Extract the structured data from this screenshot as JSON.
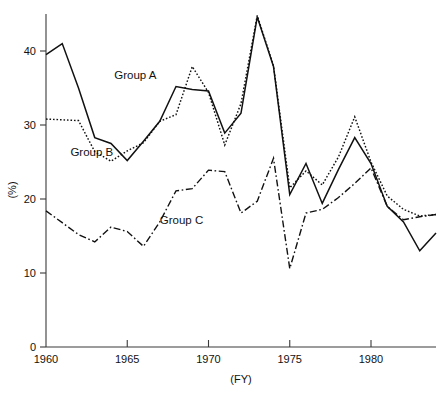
{
  "chart_data": {
    "type": "line",
    "title": "",
    "xlabel": "(FY)",
    "ylabel": "(%)",
    "xlim": [
      1960,
      1984
    ],
    "ylim": [
      0,
      45
    ],
    "xticks": [
      1960,
      1965,
      1970,
      1975,
      1980
    ],
    "xtick_labels": [
      "1960",
      "1965",
      "1970",
      "1975",
      "1980"
    ],
    "yticks": [
      0,
      10,
      20,
      30,
      40
    ],
    "ytick_labels": [
      "0",
      "10",
      "20",
      "30",
      "40"
    ],
    "grid": false,
    "legend_position": "inline-annotations",
    "x": [
      1960,
      1961,
      1962,
      1963,
      1964,
      1965,
      1966,
      1967,
      1968,
      1969,
      1970,
      1971,
      1972,
      1973,
      1974,
      1975,
      1976,
      1977,
      1978,
      1979,
      1980,
      1981,
      1982,
      1983,
      1984
    ],
    "series": [
      {
        "name": "Group A",
        "line_style": "solid",
        "values": [
          39.5,
          41.0,
          35.0,
          28.3,
          27.5,
          25.2,
          27.8,
          30.5,
          35.2,
          34.8,
          34.6,
          28.9,
          31.6,
          44.6,
          37.9,
          20.6,
          24.8,
          19.4,
          24.0,
          28.3,
          24.8,
          19.0,
          16.9,
          13.0,
          15.4
        ]
      },
      {
        "name": "Group B",
        "line_style": "dotted",
        "values": [
          30.8,
          30.7,
          30.6,
          26.4,
          25.1,
          26.5,
          27.6,
          30.5,
          31.4,
          37.9,
          34.4,
          27.3,
          32.9,
          44.8,
          38.0,
          21.5,
          23.8,
          21.9,
          25.7,
          31.1,
          25.0,
          20.4,
          18.6,
          17.7,
          17.9
        ]
      },
      {
        "name": "Group C",
        "line_style": "dash-dot",
        "values": [
          18.4,
          16.8,
          15.2,
          14.2,
          16.2,
          15.6,
          13.6,
          16.9,
          21.1,
          21.4,
          23.9,
          23.7,
          18.1,
          19.7,
          25.5,
          10.6,
          18.1,
          18.6,
          20.2,
          22.1,
          24.2,
          19.0,
          17.2,
          17.6,
          17.9
        ]
      }
    ],
    "annotations": [
      {
        "text": "Group A",
        "x": 1964.2,
        "y": 36.2
      },
      {
        "text": "Group B",
        "x": 1961.5,
        "y": 25.8
      },
      {
        "text": "Group C",
        "x": 1967.0,
        "y": 16.6
      }
    ]
  },
  "colors": {
    "axis": "#3a3a3a",
    "text": "#111111",
    "series": "#111111",
    "background": "#ffffff"
  }
}
